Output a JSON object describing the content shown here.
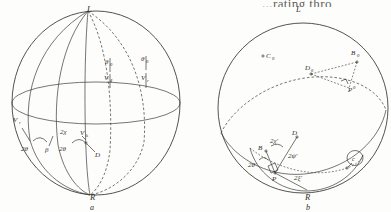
{
  "figure": {
    "kind": "scanned-geometry-figure",
    "ink_color": "#35342f",
    "paper_color": "#fdfdfb",
    "truncated_header_text": "...rating thro"
  },
  "panel_a": {
    "caption": "a",
    "pole_top_label": "L",
    "pole_bottom_label": "R",
    "labels": [
      {
        "id": "a-L",
        "text": "L",
        "x": 87,
        "y": 12
      },
      {
        "id": "a-R",
        "text": "R",
        "x": 93,
        "y": 196
      },
      {
        "id": "a-Vr",
        "text": "V",
        "sub": "r",
        "x": 16,
        "y": 122
      },
      {
        "id": "a-2theta-left",
        "text": "2θ",
        "x": 24,
        "y": 148
      },
      {
        "id": "a-beta",
        "text": "β",
        "x": 46,
        "y": 150
      },
      {
        "id": "a-2chi",
        "text": "2χ",
        "x": 63,
        "y": 135
      },
      {
        "id": "a-2theta-right",
        "text": "2θ",
        "x": 62,
        "y": 148
      },
      {
        "id": "a-Vk",
        "text": "V",
        "sub": "k",
        "x": 84,
        "y": 139
      },
      {
        "id": "a-D",
        "text": "D",
        "x": 96,
        "y": 155
      },
      {
        "id": "a-theta0",
        "text": "θ",
        "sub": "0",
        "x": 108,
        "y": 63
      },
      {
        "id": "a-V4",
        "text": "V",
        "sub": "4",
        "x": 107,
        "y": 78
      },
      {
        "id": "a-theta0b",
        "text": "θ",
        "sub": "0",
        "x": 143,
        "y": 60
      },
      {
        "id": "a-Vr2",
        "text": "V",
        "sub": "r",
        "x": 145,
        "y": 78
      }
    ]
  },
  "panel_b": {
    "caption": "b",
    "pole_top_label": "L",
    "pole_bottom_label": "R",
    "circled_label": "c",
    "labels": [
      {
        "id": "b-L",
        "text": "L",
        "x": 296,
        "y": 12
      },
      {
        "id": "b-R",
        "text": "R",
        "x": 308,
        "y": 196
      },
      {
        "id": "b-C0",
        "text": "C",
        "sub": "0",
        "x": 266,
        "y": 57
      },
      {
        "id": "b-B0",
        "text": "B",
        "sub": "0",
        "x": 343,
        "y": 54
      },
      {
        "id": "b-D0",
        "text": "D",
        "sub": "0",
        "x": 308,
        "y": 69
      },
      {
        "id": "b-P0",
        "text": "P",
        "sup": "0",
        "x": 348,
        "y": 85
      },
      {
        "id": "b-D",
        "text": "D",
        "x": 293,
        "y": 134
      },
      {
        "id": "b-B",
        "text": "B",
        "x": 261,
        "y": 148
      },
      {
        "id": "b-P",
        "text": "P",
        "x": 271,
        "y": 177
      },
      {
        "id": "b-2chiP",
        "text": "2χ'",
        "x": 272,
        "y": 144
      },
      {
        "id": "b-2psiP",
        "text": "2ψ'",
        "x": 290,
        "y": 156
      },
      {
        "id": "b-2thetaP",
        "text": "2θ'",
        "x": 251,
        "y": 165
      },
      {
        "id": "b-2xiP",
        "text": "2ξ'",
        "x": 297,
        "y": 178
      },
      {
        "id": "b-c",
        "text": "c",
        "x": 353,
        "y": 161
      }
    ]
  },
  "geometry": {
    "panel_a": {
      "sphere_center": [
        96,
        103
      ],
      "sphere_radius_x": 84,
      "sphere_radius_y": 92,
      "equator_ry": 21,
      "meridian_count": 5
    },
    "panel_b": {
      "sphere_center": [
        303,
        108
      ],
      "sphere_radius": 85,
      "great_circle_tilt_deg": -28
    }
  }
}
